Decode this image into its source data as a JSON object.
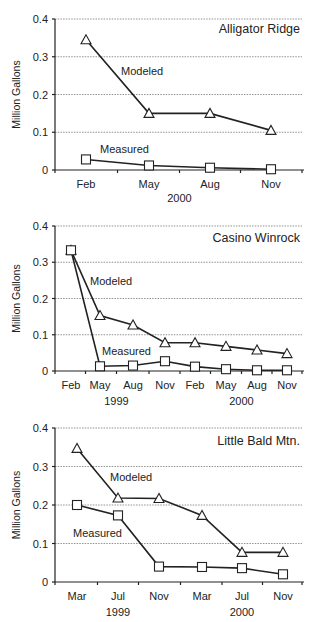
{
  "chart_data": [
    {
      "type": "line",
      "title": "Alligator Ridge",
      "xlabel": "",
      "ylabel": "Million Gallons",
      "ylim": [
        0,
        0.4
      ],
      "yticks": [
        "0",
        "0.1",
        "0.2",
        "0.3",
        "0.4"
      ],
      "grid": true,
      "categories": [
        "Feb",
        "May",
        "Aug",
        "Nov"
      ],
      "year_labels": [
        {
          "label": "2000",
          "at_index": 1.5
        }
      ],
      "series": [
        {
          "name": "Modeled",
          "marker": "triangle",
          "values": [
            0.345,
            0.15,
            0.15,
            0.105
          ]
        },
        {
          "name": "Measured",
          "marker": "square",
          "values": [
            0.028,
            0.012,
            0.006,
            0.002
          ]
        }
      ]
    },
    {
      "type": "line",
      "title": "Casino Winrock",
      "xlabel": "",
      "ylabel": "Million Gallons",
      "ylim": [
        0,
        0.4
      ],
      "yticks": [
        "0",
        "0.1",
        "0.2",
        "0.3",
        "0.4"
      ],
      "grid": true,
      "categories": [
        "Feb",
        "May",
        "Aug",
        "Nov",
        "Feb",
        "May",
        "Aug",
        "Nov"
      ],
      "year_labels": [
        {
          "label": "1999",
          "at_index": 1.5
        },
        {
          "label": "2000",
          "at_index": 5.5
        }
      ],
      "series": [
        {
          "name": "Modeled",
          "marker": "triangle",
          "values": [
            0.333,
            0.153,
            0.127,
            0.078,
            0.078,
            0.068,
            0.058,
            0.048
          ]
        },
        {
          "name": "Measured",
          "marker": "square",
          "values": [
            0.333,
            0.013,
            0.015,
            0.027,
            0.012,
            0.005,
            0.002,
            0.002
          ]
        }
      ]
    },
    {
      "type": "line",
      "title": "Little Bald Mtn.",
      "xlabel": "",
      "ylabel": "Million Gallons",
      "ylim": [
        0,
        0.4
      ],
      "yticks": [
        "0",
        "0.1",
        "0.2",
        "0.3",
        "0.4"
      ],
      "grid": true,
      "categories": [
        "Mar",
        "Jul",
        "Nov",
        "Mar",
        "Jul",
        "Nov"
      ],
      "year_labels": [
        {
          "label": "1999",
          "at_index": 1
        },
        {
          "label": "2000",
          "at_index": 4
        }
      ],
      "series": [
        {
          "name": "Modeled",
          "marker": "triangle",
          "values": [
            0.347,
            0.218,
            0.217,
            0.173,
            0.077,
            0.077
          ]
        },
        {
          "name": "Measured",
          "marker": "square",
          "values": [
            0.2,
            0.173,
            0.04,
            0.039,
            0.036,
            0.02
          ]
        }
      ]
    }
  ]
}
